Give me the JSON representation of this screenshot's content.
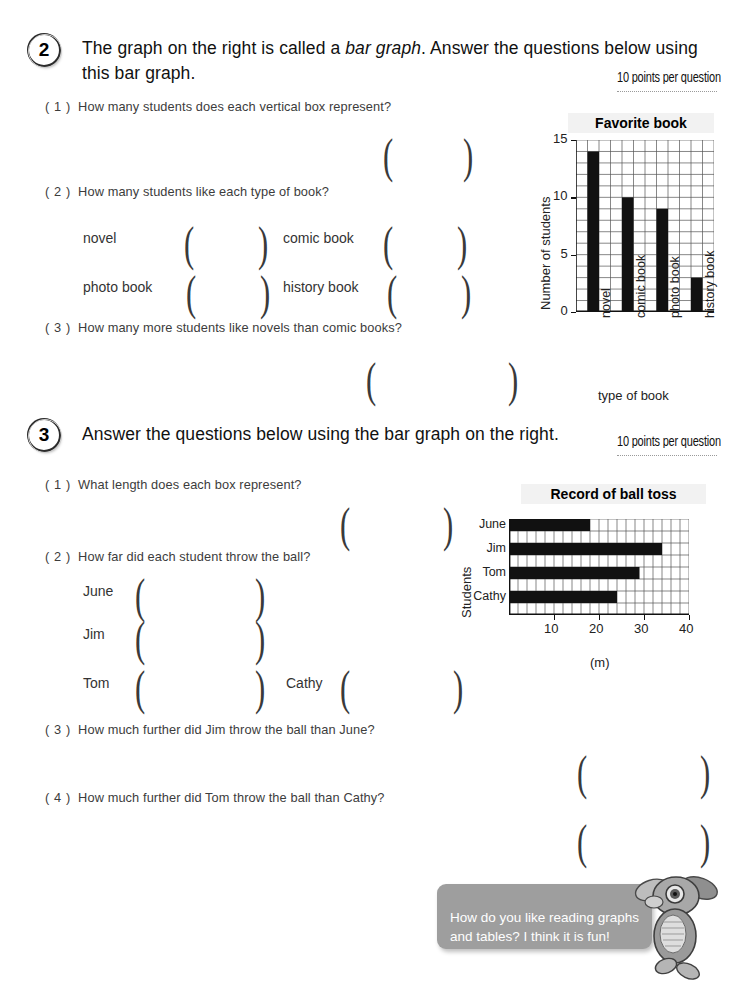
{
  "sections": [
    {
      "number": "2",
      "title_html": "The graph on the right is called a <em>bar graph</em>. Answer the questions below using this bar graph.",
      "title_plain": "The graph on the right is called a bar graph. Answer the questions below using this bar graph.",
      "points_note": "10 points per question",
      "questions": [
        {
          "num": "( 1 )",
          "text": "How many students does each vertical box represent?"
        },
        {
          "num": "( 2 )",
          "text": "How many students like each type of book?"
        },
        {
          "num": "( 3 )",
          "text": "How many more students like novels than comic books?"
        }
      ],
      "answer_items": [
        "novel",
        "comic book",
        "photo book",
        "history book"
      ]
    },
    {
      "number": "3",
      "title_html": "Answer the questions below using the bar graph on the right.",
      "title_plain": "Answer the questions below using the bar graph on the right.",
      "points_note": "10 points per question",
      "questions": [
        {
          "num": "( 1 )",
          "text": "What length does each box represent?"
        },
        {
          "num": "( 2 )",
          "text": "How far did each student throw the ball?"
        },
        {
          "num": "( 3 )",
          "text": "How much further did Jim throw the ball than June?"
        },
        {
          "num": "( 4 )",
          "text": "How much further did Tom throw the ball than Cathy?"
        }
      ],
      "answer_items": [
        "June",
        "Jim",
        "Tom",
        "Cathy"
      ]
    }
  ],
  "chart_data": [
    {
      "type": "bar",
      "orientation": "vertical",
      "title": "Favorite book",
      "xlabel": "type of book",
      "ylabel": "Number of students",
      "categories": [
        "novel",
        "comic book",
        "photo book",
        "history book"
      ],
      "values": [
        14,
        10,
        9,
        3
      ],
      "ylim": [
        0,
        15
      ],
      "yticks": [
        0,
        5,
        10,
        15
      ],
      "ytick_labels": [
        "0",
        "5",
        "10",
        "15"
      ],
      "grid": true,
      "grid_step": 1,
      "bar_color": "#111111",
      "legend": "none"
    },
    {
      "type": "bar",
      "orientation": "horizontal",
      "title": "Record of ball toss",
      "xlabel": "(m)",
      "ylabel": "Students",
      "categories": [
        "June",
        "Jim",
        "Tom",
        "Cathy"
      ],
      "values": [
        18,
        34,
        29,
        24
      ],
      "xlim": [
        0,
        40
      ],
      "xticks": [
        10,
        20,
        30,
        40
      ],
      "xtick_labels": [
        "10",
        "20",
        "30",
        "40"
      ],
      "grid": true,
      "grid_step": 2,
      "bar_color": "#111111",
      "legend": "none"
    }
  ],
  "mascot_bubble": {
    "text": "How do you like reading graphs\nand tables? I think it is fun!",
    "bubble_color": "#9e9e9e",
    "text_color": "#ffffff"
  },
  "paren_open": "(",
  "paren_close": ")"
}
